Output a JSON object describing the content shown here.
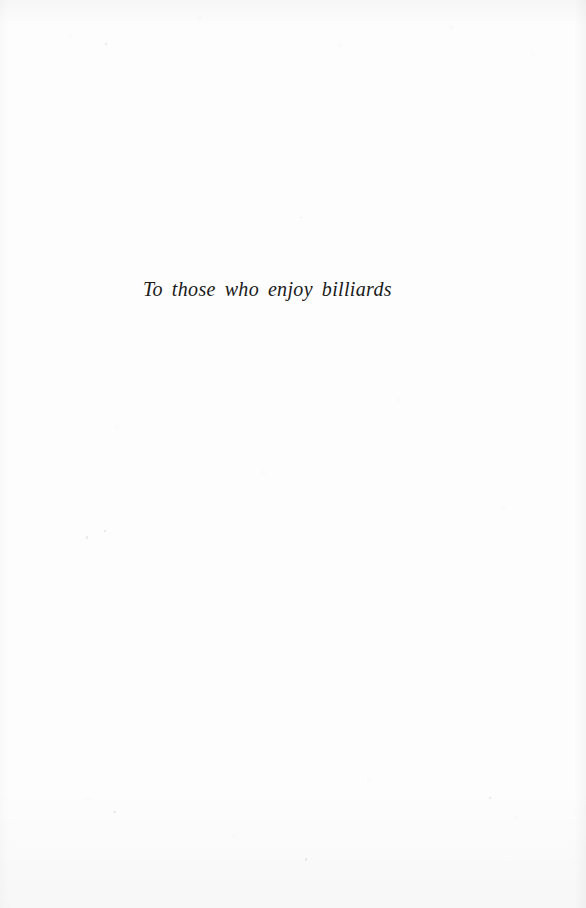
{
  "page": {
    "kind": "book-dedication-page",
    "background_color": "#fdfdfd",
    "text_color": "#1a1a1a"
  },
  "dedication": {
    "text": "To those who enjoy billiards"
  }
}
